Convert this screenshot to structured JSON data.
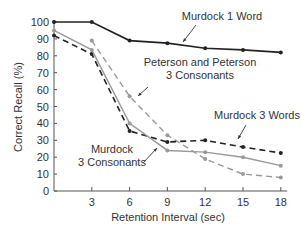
{
  "chart_data": {
    "type": "line",
    "title": "",
    "xlabel": "Retention Interval (sec)",
    "ylabel": "Correct Recall (%)",
    "x": [
      0,
      3,
      6,
      9,
      12,
      15,
      18
    ],
    "xticks": [
      3,
      6,
      9,
      12,
      15,
      18
    ],
    "yticks": [
      0,
      10,
      20,
      30,
      40,
      50,
      60,
      70,
      80,
      90,
      100
    ],
    "xlim": [
      0,
      18.5
    ],
    "ylim": [
      0,
      100
    ],
    "grid": false,
    "legend_position": "inline annotations",
    "series": [
      {
        "name": "Murdock 1 Word",
        "style": "solid",
        "color": "#222222",
        "values": [
          100,
          100,
          89,
          87.5,
          84.5,
          83.5,
          82
        ]
      },
      {
        "name": "Peterson and Peterson 3 Consonants",
        "style": "dashed",
        "color": "#999999",
        "values": [
          null,
          89,
          56,
          33,
          19,
          10,
          8
        ]
      },
      {
        "name": "Murdock 3 Words",
        "style": "dashed",
        "color": "#222222",
        "values": [
          92,
          81,
          35.5,
          29,
          30,
          26,
          22.5
        ]
      },
      {
        "name": "Murdock 3 Consonants",
        "style": "solid",
        "color": "#999999",
        "values": [
          95,
          83.5,
          40,
          24,
          23,
          20,
          15
        ]
      }
    ],
    "annotations": [
      {
        "text": "Murdock 1 Word",
        "lines": [
          "Murdock 1 Word"
        ]
      },
      {
        "text": "Peterson and Peterson 3 Consonants",
        "lines": [
          "Peterson and Peterson",
          "3 Consonants"
        ]
      },
      {
        "text": "Murdock 3 Words",
        "lines": [
          "Murdock 3 Words"
        ]
      },
      {
        "text": "Murdock 3 Consonants",
        "lines": [
          "Murdock",
          "3 Consonants"
        ]
      }
    ]
  }
}
